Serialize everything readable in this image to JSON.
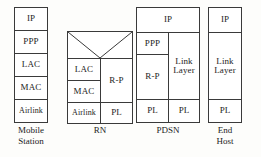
{
  "diagram": {
    "background_color": "#fdfdfb",
    "box_fill": "#ffffff",
    "border_color": "#3a3a3a",
    "text_color": "#1c1c1c"
  },
  "nodes": [
    {
      "id": "mobile-station",
      "label": "Mobile\nStation",
      "layers": [
        {
          "name": "IP"
        },
        {
          "name": "PPP"
        },
        {
          "name": "LAC"
        },
        {
          "name": "MAC"
        },
        {
          "name": "Airlink"
        }
      ]
    },
    {
      "id": "rn",
      "label": "RN",
      "layers": [
        {
          "name": ""
        },
        {
          "name": "LAC"
        },
        {
          "name": "MAC"
        },
        {
          "name": "Airlink"
        },
        {
          "name": "R-P"
        },
        {
          "name": "PL"
        }
      ]
    },
    {
      "id": "pdsn",
      "label": "PDSN",
      "layers": [
        {
          "name": "IP"
        },
        {
          "name": "PPP"
        },
        {
          "name": "R-P"
        },
        {
          "name": "PL"
        },
        {
          "name": "Link\nLayer"
        },
        {
          "name": "PL"
        }
      ]
    },
    {
      "id": "end-host",
      "label": "End\nHost",
      "layers": [
        {
          "name": "IP"
        },
        {
          "name": "Link\nLayer"
        },
        {
          "name": "PL"
        }
      ]
    }
  ],
  "labels": {
    "ip": "IP",
    "ppp": "PPP",
    "lac": "LAC",
    "mac": "MAC",
    "airlink": "Airlink",
    "rp": "R-P",
    "pl": "PL",
    "link_layer": "Link\nLayer",
    "mobile_station": "Mobile\nStation",
    "rn": "RN",
    "pdsn": "PDSN",
    "end_host": "End\nHost"
  }
}
